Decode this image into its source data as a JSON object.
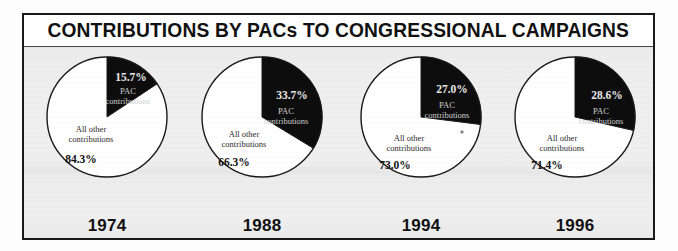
{
  "figure": {
    "title": "CONTRIBUTIONS BY PACs TO CONGRESSIONAL CAMPAIGNS",
    "pac_label_line1": "PAC",
    "pac_label_line2": "contributions",
    "other_label_line1": "All other",
    "other_label_line2": "contributions",
    "colors": {
      "pac_slice": "#0d0d0d",
      "other_slice": "#ffffff",
      "outline": "#1a1a1a",
      "frame_border": "#1a1a1a",
      "title_band": "#ffffff",
      "plot_background": "#ececec",
      "pct_on_dark": "#e8e8e8",
      "pct_on_light": "#111111"
    }
  },
  "chart_data": {
    "type": "pie",
    "title": "CONTRIBUTIONS BY PACs TO CONGRESSIONAL CAMPAIGNS",
    "xlabel": "",
    "ylabel": "",
    "legend_position": "in-slice",
    "grid": false,
    "series_names": [
      "PAC contributions",
      "All other contributions"
    ],
    "units": "percent",
    "charts": [
      {
        "year": "1974",
        "slices": [
          {
            "name": "PAC contributions",
            "label": "15.7%",
            "value": 15.7,
            "color": "#0d0d0d"
          },
          {
            "name": "All other contributions",
            "label": "84.3%",
            "value": 84.3,
            "color": "#ffffff"
          }
        ]
      },
      {
        "year": "1988",
        "slices": [
          {
            "name": "PAC contributions",
            "label": "33.7%",
            "value": 33.7,
            "color": "#0d0d0d"
          },
          {
            "name": "All other contributions",
            "label": "66.3%",
            "value": 66.3,
            "color": "#ffffff"
          }
        ]
      },
      {
        "year": "1994",
        "slices": [
          {
            "name": "PAC contributions",
            "label": "27.0%",
            "value": 27.0,
            "color": "#0d0d0d"
          },
          {
            "name": "All other contributions",
            "label": "73.0%",
            "value": 73.0,
            "color": "#ffffff"
          }
        ]
      },
      {
        "year": "1996",
        "slices": [
          {
            "name": "PAC contributions",
            "label": "28.6%",
            "value": 28.6,
            "color": "#0d0d0d"
          },
          {
            "name": "All other contributions",
            "label": "71.4%",
            "value": 71.4,
            "color": "#ffffff"
          }
        ]
      }
    ]
  }
}
